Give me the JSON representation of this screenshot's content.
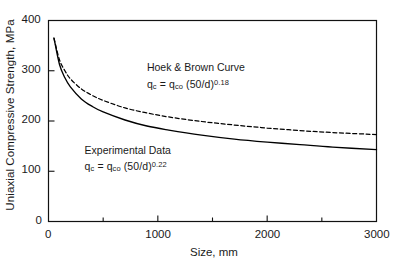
{
  "chart_data": {
    "type": "line",
    "title": "",
    "xlabel": "Size, mm",
    "ylabel": "Uniaxial Compressive Strength, MPa",
    "xlim": [
      0,
      3000
    ],
    "ylim": [
      0,
      400
    ],
    "xticks": [
      0,
      1000,
      2000,
      3000
    ],
    "xtick_labels": [
      "0",
      "1000",
      "2000",
      "3000"
    ],
    "xminor_ticks": [
      500,
      1500,
      2500
    ],
    "yticks": [
      0,
      100,
      200,
      300,
      400
    ],
    "ytick_labels": [
      "0",
      "100",
      "200",
      "300",
      "400"
    ],
    "grid": false,
    "legend": "none",
    "series": [
      {
        "name": "Hoek & Brown Curve",
        "style": "dashed",
        "color": "#000000",
        "formula": "q_c = q_co (50/d)^0.18",
        "exponent": 0.18,
        "reference_size_mm": 50,
        "reference_strength_mpa": 365,
        "x": [
          50,
          100,
          150,
          200,
          300,
          400,
          500,
          700,
          900,
          1100,
          1400,
          1700,
          2000,
          2300,
          2600,
          3000
        ],
        "y": [
          365,
          322,
          300,
          284,
          264,
          251,
          241,
          226,
          216,
          208,
          199,
          192,
          186,
          181,
          177,
          173
        ]
      },
      {
        "name": "Experimental Data",
        "style": "solid",
        "color": "#000000",
        "formula": "q_c = q_co (50/d)^0.22",
        "exponent": 0.22,
        "reference_size_mm": 50,
        "reference_strength_mpa": 365,
        "x": [
          50,
          100,
          150,
          200,
          300,
          400,
          500,
          700,
          900,
          1100,
          1400,
          1700,
          2000,
          2300,
          2600,
          3000
        ],
        "y": [
          365,
          313,
          286,
          268,
          244,
          229,
          218,
          202,
          190,
          182,
          172,
          164,
          158,
          153,
          148,
          143
        ]
      }
    ],
    "annotations": [
      {
        "id": "hoek-brown",
        "line1": "Hoek & Brown Curve",
        "eq_lhs": "q",
        "eq_lhs_sub": "c",
        "eq_eq": " = q",
        "eq_rhs_sub": "co",
        "eq_rhs": " (50/d)",
        "eq_sup": "0.18",
        "x_mm": 900,
        "y_mpa": 305
      },
      {
        "id": "experimental-data",
        "line1": "Experimental Data",
        "eq_lhs": "q",
        "eq_lhs_sub": "c",
        "eq_eq": " = q",
        "eq_rhs_sub": "co",
        "eq_rhs": " (50/d)",
        "eq_sup": "0.22",
        "x_mm": 330,
        "y_mpa": 140
      }
    ],
    "axis_color": "#111111",
    "background_color": "#ffffff"
  },
  "axis": {
    "y_title": "Uniaxial Compressive Strength, MPa",
    "x_title": "Size, mm",
    "y_tick_0": "0",
    "y_tick_1": "100",
    "y_tick_2": "200",
    "y_tick_3": "300",
    "y_tick_4": "400",
    "x_tick_0": "0",
    "x_tick_1": "1000",
    "x_tick_2": "2000",
    "x_tick_3": "3000"
  },
  "annotations": {
    "hoek_title": "Hoek & Brown Curve",
    "hoek_eq_q": "q",
    "hoek_eq_c": "c",
    "hoek_eq_mid": " = q",
    "hoek_eq_co": "co",
    "hoek_eq_tail": " (50/d)",
    "hoek_eq_exp": "0.18",
    "exp_title": "Experimental Data",
    "exp_eq_q": "q",
    "exp_eq_c": "c",
    "exp_eq_mid": " = q",
    "exp_eq_co": "co",
    "exp_eq_tail": " (50/d)",
    "exp_eq_exp": "0.22"
  }
}
